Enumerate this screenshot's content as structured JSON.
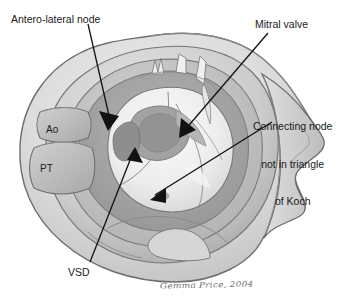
{
  "figure": {
    "type": "anatomical-illustration",
    "background_color": "#ffffff",
    "ink_color": "#1a1a1a"
  },
  "callouts": [
    {
      "id": "antero-lateral-node",
      "text": "Antero-lateral node",
      "lines": [
        "Antero-lateral node"
      ],
      "leader_from": [
        88,
        24
      ],
      "leader_to": [
        108,
        122
      ],
      "arrow_tip": [
        108,
        122
      ]
    },
    {
      "id": "mitral-valve",
      "text": "Mitral valve",
      "lines": [
        "Mitral valve"
      ],
      "leader_from": [
        268,
        33
      ],
      "leader_to": [
        182,
        133
      ],
      "arrow_tip": [
        182,
        133
      ]
    },
    {
      "id": "connecting-node",
      "text": "Connecting node not in triangle of Koch",
      "lines": [
        "Connecting node",
        "not in triangle",
        "of Koch"
      ],
      "leader_from": [
        272,
        122
      ],
      "leader_to": [
        153,
        197
      ],
      "arrow_tip": [
        153,
        197
      ]
    },
    {
      "id": "vsd",
      "text": "VSD",
      "lines": [
        "VSD"
      ],
      "leader_from": [
        90,
        262
      ],
      "leader_to": [
        136,
        152
      ],
      "arrow_tip": [
        136,
        152
      ]
    }
  ],
  "inline_labels": [
    {
      "id": "aorta",
      "text": "Ao",
      "x": 46,
      "y": 124
    },
    {
      "id": "pulmonary-trunk",
      "text": "PT",
      "x": 40,
      "y": 163
    }
  ],
  "signature": {
    "text": "Gemma Price, 2004"
  },
  "palette": {
    "outer_wall_light": "#e3e3e3",
    "outer_wall_mid": "#cfcfcf",
    "wall_shadow": "#b4b4b4",
    "chamber_dark": "#9a9a9a",
    "chamber_mid": "#bdbdbd",
    "valve_light": "#ededed",
    "valve_highlight": "#f7f7f7",
    "outline": "#6a6a6a",
    "arrow": "#111111"
  }
}
